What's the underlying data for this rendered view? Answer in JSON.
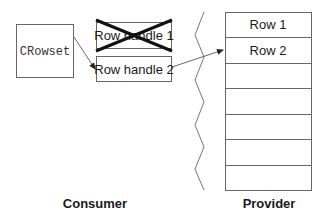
{
  "consumer": {
    "object_label": "CRowset",
    "row_handles": [
      {
        "label": "Row handle 1",
        "state": "released"
      },
      {
        "label": "Row handle 2",
        "state": "active"
      }
    ],
    "section_label": "Consumer"
  },
  "provider": {
    "rows": [
      "Row 1",
      "Row 2",
      "",
      "",
      "",
      "",
      ""
    ],
    "section_label": "Provider"
  },
  "colors": {
    "line": "#555555",
    "cross": "#111111",
    "text": "#1a1a1a"
  }
}
